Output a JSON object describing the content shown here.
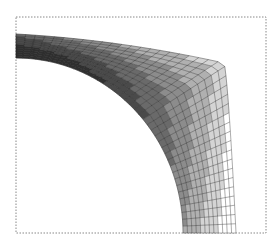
{
  "figure": {
    "type": "finite-element-contour-mesh",
    "bounding_box": {
      "x1": 16,
      "y1": 17,
      "x2": 266,
      "y2": 233,
      "style": "dotted",
      "color": "#888888"
    },
    "geometry": {
      "outer_top_left": [
        16,
        34
      ],
      "inner_top_left": [
        16,
        58
      ],
      "outer_corner": [
        224,
        63
      ],
      "outer_bottom_right": [
        236,
        233
      ],
      "inner_bottom_left": [
        183,
        233
      ]
    },
    "mesh": {
      "radial_divisions": 12,
      "arc_divisions": 40,
      "line_color": "#222222"
    },
    "bands": [
      {
        "level": 1,
        "color": "#303030"
      },
      {
        "level": 2,
        "color": "#4a4a4a"
      },
      {
        "level": 3,
        "color": "#6a6a6a"
      },
      {
        "level": 4,
        "color": "#8c8c8c"
      },
      {
        "level": 5,
        "color": "#b0b0b0"
      },
      {
        "level": 6,
        "color": "#d4d4d4"
      },
      {
        "level": 7,
        "color": "#ffffff"
      }
    ]
  }
}
